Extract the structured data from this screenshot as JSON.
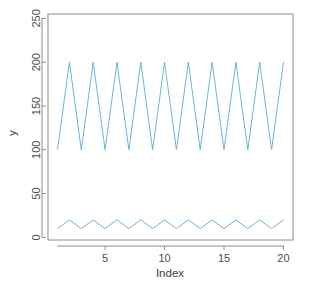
{
  "chart_data": {
    "type": "line",
    "title": "",
    "subtitle": "",
    "xlabel": "Index",
    "ylabel": "y",
    "xlim": [
      0.2,
      20.8
    ],
    "ylim": [
      -3,
      255
    ],
    "grid": false,
    "legend": false,
    "legend_position": "none",
    "line_color": "#6FB3DC",
    "line_width": 1,
    "axis_color": "#8c8c8c",
    "box": true,
    "x": [
      1,
      2,
      3,
      4,
      5,
      6,
      7,
      8,
      9,
      10,
      11,
      12,
      13,
      14,
      15,
      16,
      17,
      18,
      19,
      20
    ],
    "xticks": [
      5,
      10,
      15,
      20
    ],
    "xtick_labels": [
      "5",
      "10",
      "15",
      "20"
    ],
    "yticks": [
      0,
      50,
      100,
      150,
      200,
      250
    ],
    "ytick_labels": [
      "0",
      "50",
      "100",
      "150",
      "200",
      "250"
    ],
    "series": [
      {
        "name": "upper",
        "values": [
          100,
          200,
          100,
          200,
          100,
          200,
          100,
          200,
          100,
          200,
          100,
          200,
          100,
          200,
          100,
          200,
          100,
          200,
          100,
          200
        ]
      },
      {
        "name": "lower",
        "values": [
          10,
          20,
          10,
          20,
          10,
          20,
          10,
          20,
          10,
          20,
          10,
          20,
          10,
          20,
          10,
          20,
          10,
          20,
          10,
          20
        ]
      }
    ]
  },
  "plot_area": {
    "left": 48,
    "top": 14,
    "right": 293,
    "bottom": 240
  }
}
